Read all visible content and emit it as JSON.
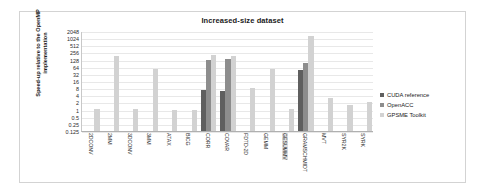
{
  "chart_data": {
    "type": "bar",
    "title": "Increased-size dataset",
    "xlabel": "",
    "ylabel": "Speed-up relative to the OpenMP implementation",
    "yscale": "log2",
    "ylim": [
      0.125,
      2048
    ],
    "yticks": [
      2048,
      1024,
      512,
      256,
      128,
      64,
      32,
      16,
      8,
      4,
      2,
      1,
      0.5,
      0.25,
      0.125
    ],
    "ytick_labels": [
      "2048",
      "1024",
      "512",
      "256",
      "128",
      "64",
      "32",
      "16",
      "8",
      "4",
      "2",
      "1",
      "0.5",
      "0.25",
      "0.125"
    ],
    "grid": true,
    "legend_position": "right",
    "categories": [
      "2DCONV",
      "2MM",
      "3DCONV",
      "3MM",
      "ATAX",
      "BICG",
      "CORR",
      "COVAR",
      "FDTD-2D",
      "GEMM",
      "GESUMMV",
      "GRAMSCHMIDT",
      "MVT",
      "SYR2K",
      "SYRK"
    ],
    "series": [
      {
        "name": "CUDA reference",
        "color": "#5f5f5f",
        "values": [
          null,
          null,
          null,
          null,
          null,
          null,
          6.5,
          6.0,
          null,
          null,
          null,
          48,
          null,
          null,
          null
        ]
      },
      {
        "name": "OpenACC",
        "color": "#8d8d8d",
        "values": [
          null,
          null,
          null,
          null,
          null,
          null,
          128,
          130,
          null,
          null,
          null,
          88,
          null,
          null,
          null
        ]
      },
      {
        "name": "GPSME Toolkit",
        "color": "#d2d2d2",
        "values": [
          1.02,
          180,
          1.02,
          50,
          1.0,
          1.0,
          200,
          190,
          8.5,
          50,
          1.05,
          1300,
          3.0,
          1.6,
          2.1
        ]
      }
    ]
  },
  "legend": {
    "items": [
      {
        "label": "CUDA reference"
      },
      {
        "label": "OpenACC"
      },
      {
        "label": "GPSME Toolkit"
      }
    ]
  }
}
